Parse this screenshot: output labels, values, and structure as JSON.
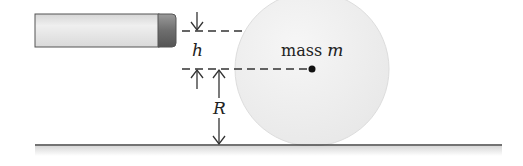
{
  "diagram": {
    "type": "physics-setup",
    "labels": {
      "h": "h",
      "R": "R",
      "mass_prefix": "mass ",
      "mass_symbol": "m"
    },
    "colors": {
      "ball_fill": "#eeeeee",
      "ball_edge": "#dcdcdc",
      "stick_body": "#e2e2e2",
      "stick_tip": "#7a7a7a",
      "line": "#333333",
      "ground_shadow": "#e6e6e6"
    }
  }
}
